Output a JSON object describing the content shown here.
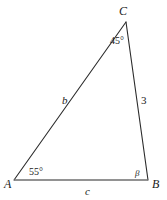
{
  "figure": {
    "type": "triangle-diagram",
    "background_color": "#ffffff",
    "stroke_color": "#2b2b2b",
    "base_stroke_color": "#666666",
    "text_color": "#1a1a1a",
    "vertices": [
      {
        "name": "A",
        "label": "A",
        "x": 14,
        "y": 180
      },
      {
        "name": "B",
        "label": "B",
        "x": 148,
        "y": 180
      },
      {
        "name": "C",
        "label": "C",
        "x": 126,
        "y": 22
      }
    ],
    "sides": [
      {
        "name": "side-b",
        "label": "b",
        "from": "A",
        "to": "C",
        "kind": "variable"
      },
      {
        "name": "side-c",
        "label": "c",
        "from": "A",
        "to": "B",
        "kind": "variable"
      },
      {
        "name": "side-a",
        "label": "3",
        "from": "C",
        "to": "B",
        "kind": "length"
      }
    ],
    "angles": [
      {
        "name": "angle-A",
        "at": "A",
        "label": "55°",
        "value": 55,
        "unit": "degrees",
        "known": true
      },
      {
        "name": "angle-C",
        "at": "C",
        "label": "45°",
        "value": 45,
        "unit": "degrees",
        "known": true
      },
      {
        "name": "angle-B",
        "at": "B",
        "label": "β",
        "value": null,
        "unit": "degrees",
        "known": false
      }
    ]
  }
}
